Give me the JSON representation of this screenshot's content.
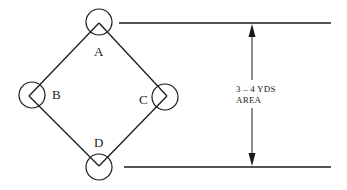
{
  "diagram": {
    "title": "",
    "colors": {
      "ink": "#1a1a1a",
      "background": "#ffffff"
    },
    "nodes": [
      {
        "id": "A",
        "label": "A"
      },
      {
        "id": "B",
        "label": "B"
      },
      {
        "id": "C",
        "label": "C"
      },
      {
        "id": "D",
        "label": "D"
      }
    ],
    "edges": [
      {
        "from": "A",
        "to": "C"
      },
      {
        "from": "C",
        "to": "D"
      },
      {
        "from": "D",
        "to": "B"
      },
      {
        "from": "B",
        "to": "A"
      }
    ],
    "dimension": {
      "line1": "3 – 4 YDS",
      "line2": "AREA"
    }
  }
}
